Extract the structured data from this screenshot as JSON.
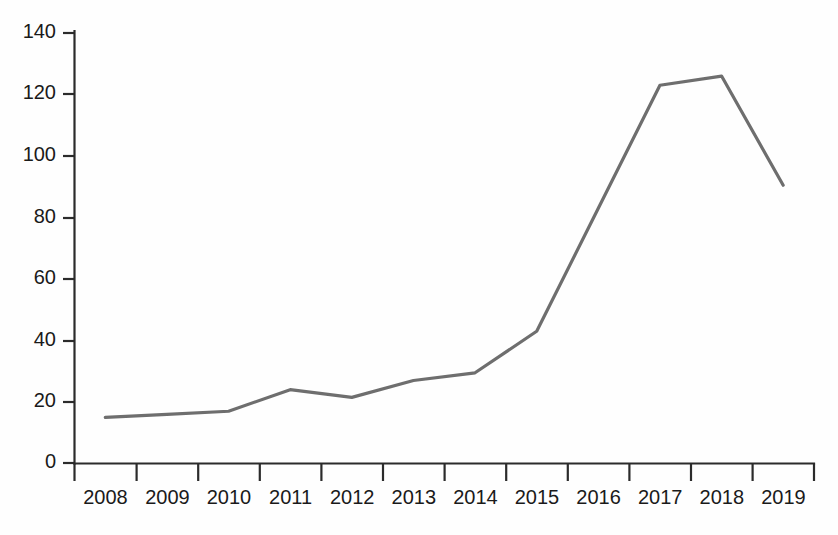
{
  "chart_data": {
    "type": "line",
    "title": "",
    "subtitle": "",
    "xlabel": "",
    "ylabel": "",
    "categories": [
      "2008",
      "2009",
      "2010",
      "2011",
      "2012",
      "2013",
      "2014",
      "2015",
      "2016",
      "2017",
      "2018",
      "2019"
    ],
    "values": [
      15,
      16,
      17,
      24,
      21.5,
      27,
      29.5,
      43,
      83,
      123,
      126,
      90.5
    ],
    "series": [
      {
        "name": "series-1",
        "values": [
          15,
          16,
          17,
          24,
          21.5,
          27,
          29.5,
          43,
          83,
          123,
          126,
          90.5
        ],
        "color": "#6e6e6e"
      }
    ],
    "ylim": [
      0,
      140
    ],
    "yticks": [
      0,
      20,
      40,
      60,
      80,
      100,
      120,
      140
    ],
    "ytick_labels": [
      "0",
      "20",
      "40",
      "60",
      "80",
      "100",
      "120",
      "140"
    ],
    "xtick_labels": [
      "2008",
      "2009",
      "2010",
      "2011",
      "2012",
      "2013",
      "2014",
      "2015",
      "2016",
      "2017",
      "2018",
      "2019"
    ],
    "grid": false,
    "legend": null,
    "legend_position": "none",
    "annotations": []
  },
  "style": {
    "line_color": "#6e6e6e",
    "axis_color": "#2b2b2b",
    "label_color": "#1a1a1a",
    "background": "#fefefe"
  }
}
